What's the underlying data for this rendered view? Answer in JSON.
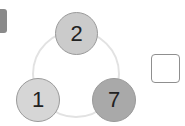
{
  "diagram": {
    "type": "number-triangle-cycle",
    "nodes": [
      {
        "position": "top",
        "value": "2",
        "fill": "#cbcbcb"
      },
      {
        "position": "bottom-left",
        "value": "1",
        "fill": "#d6d6d6"
      },
      {
        "position": "bottom-right",
        "value": "7",
        "fill": "#a9a9a9"
      }
    ],
    "ring_color": "#e2e2e2",
    "answer_box": {
      "value": ""
    }
  }
}
